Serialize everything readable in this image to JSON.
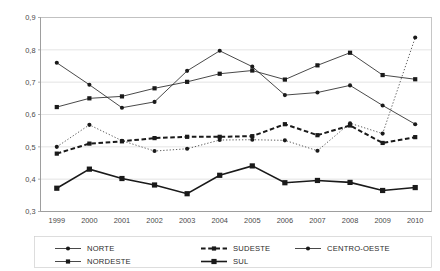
{
  "chart_data": {
    "type": "line",
    "title": "",
    "subtitle": "",
    "xlabel": "",
    "ylabel": "",
    "x": [
      "1999",
      "2000",
      "2001",
      "2002",
      "2003",
      "2004",
      "2005",
      "2006",
      "2007",
      "2008",
      "2009",
      "2010"
    ],
    "categories": [
      "1999",
      "2000",
      "2001",
      "2002",
      "2003",
      "2004",
      "2005",
      "2006",
      "2007",
      "2008",
      "2009",
      "2010"
    ],
    "ylim": [
      0.3,
      0.9
    ],
    "ytick_labels": [
      "0,3",
      "0,4",
      "0,5",
      "0,6",
      "0,7",
      "0,8",
      "0,9"
    ],
    "ytick_values": [
      0.3,
      0.4,
      0.5,
      0.6,
      0.7,
      0.8,
      0.9
    ],
    "grid": true,
    "legend_position": "bottom",
    "series": [
      {
        "name": "NORTE",
        "marker": "circle",
        "line_style": "solid",
        "line_width": 0.8,
        "color": "#1a1a1a",
        "values": [
          0.76,
          0.692,
          0.621,
          0.639,
          0.735,
          0.797,
          0.748,
          0.66,
          0.668,
          0.69,
          0.628,
          0.57
        ]
      },
      {
        "name": "NORDESTE",
        "marker": "square",
        "line_style": "solid",
        "line_width": 0.8,
        "color": "#1a1a1a",
        "values": [
          0.623,
          0.65,
          0.656,
          0.681,
          0.701,
          0.726,
          0.736,
          0.708,
          0.752,
          0.791,
          0.722,
          0.709
        ]
      },
      {
        "name": "SUDESTE",
        "marker": "square",
        "line_style": "dashed",
        "line_width": 2.0,
        "color": "#1a1a1a",
        "values": [
          0.479,
          0.51,
          0.517,
          0.527,
          0.531,
          0.531,
          0.533,
          0.57,
          0.536,
          0.566,
          0.512,
          0.53
        ]
      },
      {
        "name": "CENTRO-OESTE",
        "marker": "circle",
        "line_style": "dotted",
        "line_width": 0.7,
        "color": "#1a1a1a",
        "values": [
          0.5,
          0.568,
          0.519,
          0.487,
          0.494,
          0.521,
          0.522,
          0.52,
          0.488,
          0.573,
          0.541,
          0.838
        ]
      },
      {
        "name": "SUL",
        "marker": "square-large",
        "line_style": "solid",
        "line_width": 1.6,
        "color": "#1a1a1a",
        "values": [
          0.372,
          0.431,
          0.402,
          0.382,
          0.355,
          0.412,
          0.441,
          0.389,
          0.396,
          0.39,
          0.365,
          0.374
        ]
      }
    ],
    "legend": [
      {
        "label": "NORTE",
        "marker": "circle",
        "line_style": "solid",
        "line_width": 0.8
      },
      {
        "label": "SUDESTE",
        "marker": "square",
        "line_style": "dashed",
        "line_width": 2.0
      },
      {
        "label": "CENTRO-OESTE",
        "marker": "circle",
        "line_style": "solid",
        "line_width": 0.8
      },
      {
        "label": "NORDESTE",
        "marker": "square",
        "line_style": "solid",
        "line_width": 0.8
      },
      {
        "label": "SUL",
        "marker": "square-large",
        "line_style": "solid",
        "line_width": 1.6
      }
    ]
  }
}
